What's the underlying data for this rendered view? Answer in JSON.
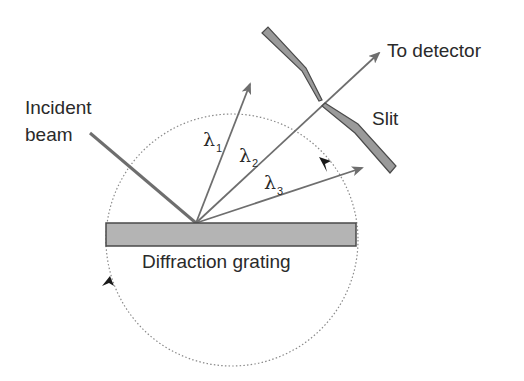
{
  "diagram": {
    "labels": {
      "incident_line1": "Incident",
      "incident_line2": "beam",
      "to_detector": "To detector",
      "slit": "Slit",
      "grating": "Diffraction grating"
    },
    "wavelengths": [
      {
        "symbol": "λ",
        "subscript": "1"
      },
      {
        "symbol": "λ",
        "subscript": "2"
      },
      {
        "symbol": "λ",
        "subscript": "3"
      }
    ],
    "rotation_indicator": "dotted circle with arrowheads indicating grating rotation",
    "colors": {
      "line": "#6e6e6e",
      "grating_fill": "#b4b4b4",
      "slit_fill": "#9a9a9a",
      "outline": "#4a4a4a",
      "dotted_circle": "#8a8a8a",
      "text": "#2a2a2a"
    }
  }
}
